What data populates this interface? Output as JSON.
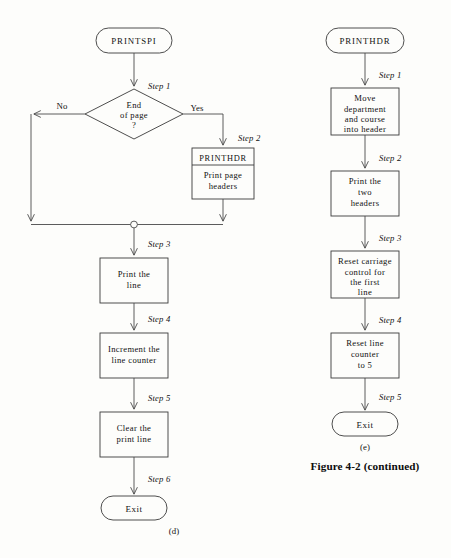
{
  "figure": {
    "caption": "Figure 4-2 (continued)",
    "part_left_label": "(d)",
    "part_right_label": "(e)"
  },
  "left_flow": {
    "start_terminal": "PRINTSPI",
    "decision": {
      "line1": "End",
      "line2": "of page",
      "line3": "?",
      "yes_label": "Yes",
      "no_label": "No",
      "step": "Step 1"
    },
    "predefined_process": {
      "header": "PRINTHDR",
      "body_line1": "Print page",
      "body_line2": "headers",
      "step": "Step 2"
    },
    "steps": [
      {
        "step": "Step 3",
        "line1": "Print the",
        "line2": "line"
      },
      {
        "step": "Step 4",
        "line1": "Increment the",
        "line2": "line counter"
      },
      {
        "step": "Step 5",
        "line1": "Clear the",
        "line2": "print line"
      }
    ],
    "end_step": "Step 6",
    "end_terminal": "Exit"
  },
  "right_flow": {
    "start_terminal": "PRINTHDR",
    "steps": [
      {
        "step": "Step 1",
        "line1": "Move",
        "line2": "department",
        "line3": "and course",
        "line4": "into header"
      },
      {
        "step": "Step 2",
        "line1": "Print the",
        "line2": "two",
        "line3": "headers"
      },
      {
        "step": "Step 3",
        "line1": "Reset carriage",
        "line2": "control for",
        "line3": "the first",
        "line4": "line"
      },
      {
        "step": "Step 4",
        "line1": "Reset line",
        "line2": "counter",
        "line3": "to 5"
      }
    ],
    "end_step": "Step 5",
    "end_terminal": "Exit"
  },
  "colors": {
    "paper": "#fdfdfb",
    "ink": "#1a1a1a",
    "line": "#4a4a4a"
  }
}
